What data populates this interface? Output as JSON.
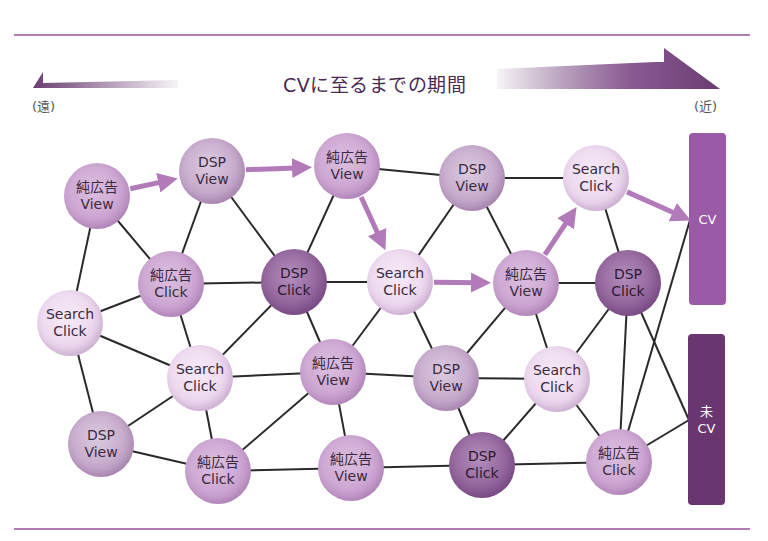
{
  "header": {
    "title": "CVに至るまでの期間",
    "far_label": "(遠)",
    "near_label": "(近)"
  },
  "colors": {
    "rule": "#b27cb9",
    "arrow_dark": "#6a3d72",
    "path_arrow": "#b27ab9",
    "edge": "#2a2a2a",
    "cv_box": "#9b5aa6",
    "not_cv_box": "#6a3670"
  },
  "nodes": [
    {
      "id": "n1",
      "line1": "純広告",
      "line2": "View",
      "type": "pure",
      "x": 97,
      "y": 196
    },
    {
      "id": "n2",
      "line1": "DSP",
      "line2": "View",
      "type": "dspview",
      "x": 212,
      "y": 171
    },
    {
      "id": "n3",
      "line1": "純広告",
      "line2": "View",
      "type": "pure",
      "x": 347,
      "y": 166
    },
    {
      "id": "n4",
      "line1": "DSP",
      "line2": "View",
      "type": "dspview",
      "x": 472,
      "y": 178
    },
    {
      "id": "n5",
      "line1": "Search",
      "line2": "Click",
      "type": "search",
      "x": 596,
      "y": 178
    },
    {
      "id": "n6",
      "line1": "純広告",
      "line2": "Click",
      "type": "pure",
      "x": 171,
      "y": 284
    },
    {
      "id": "n7",
      "line1": "DSP",
      "line2": "Click",
      "type": "dspclick",
      "x": 294,
      "y": 282
    },
    {
      "id": "n8",
      "line1": "Search",
      "line2": "Click",
      "type": "search",
      "x": 400,
      "y": 282
    },
    {
      "id": "n9",
      "line1": "純広告",
      "line2": "View",
      "type": "pure",
      "x": 526,
      "y": 283
    },
    {
      "id": "n10",
      "line1": "DSP",
      "line2": "Click",
      "type": "dspclick",
      "x": 628,
      "y": 283
    },
    {
      "id": "n11",
      "line1": "Search",
      "line2": "Click",
      "type": "search",
      "x": 70,
      "y": 323
    },
    {
      "id": "n12",
      "line1": "Search",
      "line2": "Click",
      "type": "search",
      "x": 200,
      "y": 378
    },
    {
      "id": "n13",
      "line1": "純広告",
      "line2": "View",
      "type": "pure",
      "x": 333,
      "y": 372
    },
    {
      "id": "n14",
      "line1": "DSP",
      "line2": "View",
      "type": "dspview",
      "x": 446,
      "y": 378
    },
    {
      "id": "n15",
      "line1": "Search",
      "line2": "Click",
      "type": "search",
      "x": 557,
      "y": 379
    },
    {
      "id": "n16",
      "line1": "DSP",
      "line2": "View",
      "type": "dspview",
      "x": 101,
      "y": 444
    },
    {
      "id": "n17",
      "line1": "純広告",
      "line2": "Click",
      "type": "pure",
      "x": 218,
      "y": 471
    },
    {
      "id": "n18",
      "line1": "純広告",
      "line2": "View",
      "type": "pure",
      "x": 351,
      "y": 468
    },
    {
      "id": "n19",
      "line1": "DSP",
      "line2": "Click",
      "type": "dspclick",
      "x": 482,
      "y": 465
    },
    {
      "id": "n20",
      "line1": "純広告",
      "line2": "Click",
      "type": "pure",
      "x": 619,
      "y": 462
    }
  ],
  "outcomes": {
    "cv": {
      "label": "CV"
    },
    "not_cv": {
      "line1": "未",
      "line2": "CV"
    }
  },
  "edges": [
    [
      "n1",
      "n11"
    ],
    [
      "n1",
      "n6"
    ],
    [
      "n2",
      "n6"
    ],
    [
      "n2",
      "n7"
    ],
    [
      "n3",
      "n4"
    ],
    [
      "n3",
      "n7"
    ],
    [
      "n4",
      "n5"
    ],
    [
      "n4",
      "n8"
    ],
    [
      "n4",
      "n9"
    ],
    [
      "n5",
      "n10"
    ],
    [
      "n6",
      "n7"
    ],
    [
      "n6",
      "n11"
    ],
    [
      "n6",
      "n12"
    ],
    [
      "n7",
      "n8"
    ],
    [
      "n7",
      "n12"
    ],
    [
      "n7",
      "n13"
    ],
    [
      "n8",
      "n13"
    ],
    [
      "n8",
      "n14"
    ],
    [
      "n9",
      "n10"
    ],
    [
      "n9",
      "n14"
    ],
    [
      "n9",
      "n15"
    ],
    [
      "n10",
      "n15"
    ],
    [
      "n11",
      "n12"
    ],
    [
      "n11",
      "n16"
    ],
    [
      "n12",
      "n13"
    ],
    [
      "n12",
      "n16"
    ],
    [
      "n12",
      "n17"
    ],
    [
      "n13",
      "n14"
    ],
    [
      "n13",
      "n17"
    ],
    [
      "n13",
      "n18"
    ],
    [
      "n14",
      "n15"
    ],
    [
      "n14",
      "n19"
    ],
    [
      "n15",
      "n19"
    ],
    [
      "n15",
      "n20"
    ],
    [
      "n16",
      "n17"
    ],
    [
      "n17",
      "n18"
    ],
    [
      "n18",
      "n19"
    ],
    [
      "n19",
      "n20"
    ],
    [
      "n10",
      "n20"
    ],
    [
      "n10",
      "ncv"
    ],
    [
      "n20",
      "cv"
    ],
    [
      "n20",
      "ncv"
    ]
  ],
  "path": [
    "n1",
    "n2",
    "n3",
    "n8",
    "n9",
    "n5",
    "cv"
  ]
}
